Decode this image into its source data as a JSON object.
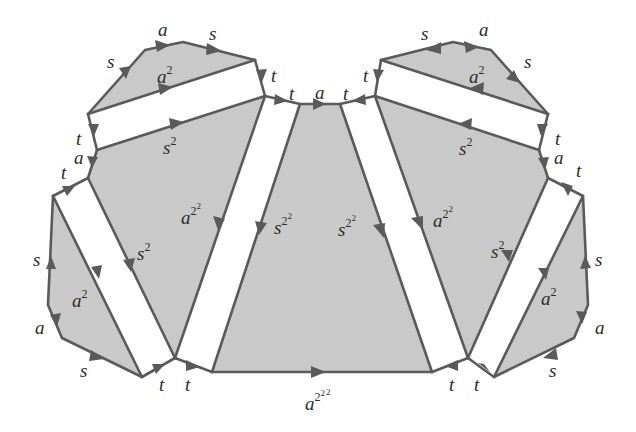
{
  "diagram": {
    "colors": {
      "cell_fill": "#c9c9c9",
      "edge": "#5a5a5a",
      "text": "#2b2b2b",
      "background": "#ffffff"
    },
    "labels": {
      "left_cap_s": "s",
      "left_cap_a": "a",
      "left_cap_s2": "s",
      "left_cap_a2_base": "a",
      "left_cap_a2_exp": "2",
      "left_t1": "t",
      "left_t2": "t",
      "center_top_a": "a",
      "right_t2": "t",
      "right_t1": "t",
      "right_cap_s": "s",
      "right_cap_a": "a",
      "right_cap_s2": "s",
      "right_cap_a2_base": "a",
      "right_cap_a2_exp": "2",
      "left_strip_t": "t",
      "left_s2_base": "s",
      "left_s2_exp": "2",
      "left_a_small": "a",
      "left_t_small": "t",
      "right_strip_t": "t",
      "right_s2_base": "s",
      "right_s2_exp": "2",
      "right_a_small": "a",
      "right_t_small": "t",
      "left_a22_base": "a",
      "left_a22_exp1": "2",
      "left_a22_exp2": "2",
      "left_s22_base": "s",
      "left_s22_exp1": "2",
      "left_s22_exp2": "2",
      "right_s22_base": "s",
      "right_s22_exp1": "2",
      "right_s22_exp2": "2",
      "right_a22_base": "a",
      "right_a22_exp1": "2",
      "right_a22_exp2": "2",
      "left_low_s2_base": "s",
      "left_low_s2_exp": "2",
      "left_low_a2_base": "a",
      "left_low_a2_exp": "2",
      "left_low_s": "s",
      "left_low_a": "a",
      "left_low_s_bottom": "s",
      "right_low_s2_base": "s",
      "right_low_s2_exp": "2",
      "right_low_a2_base": "a",
      "right_low_a2_exp": "2",
      "right_low_s": "s",
      "right_low_a": "a",
      "right_low_s_bottom": "s",
      "bottom_t1": "t",
      "bottom_t2": "t",
      "bottom_t3": "t",
      "bottom_t4": "t",
      "bottom_a222_base": "a",
      "bottom_a222_exp1": "2",
      "bottom_a222_exp2": "2",
      "bottom_a222_exp3": "2"
    }
  }
}
